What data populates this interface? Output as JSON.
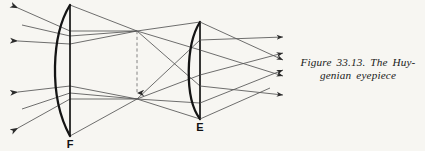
{
  "figure": {
    "background_color": "#f7f6f2",
    "ink_color": "#1a1a1a",
    "ray_color": "#4a4a4a",
    "caption_line_1": "Figure 33.13.  The Huy-",
    "caption_line_2": "genian eyepiece",
    "caption_number": "33.13",
    "caption_subject": "The Huygenian eyepiece"
  },
  "labels": {
    "field_lens": "F",
    "eye_lens": "E"
  },
  "optics": {
    "field_lens": {
      "name": "F",
      "type": "plano-convex",
      "axis_x": 70,
      "top_y": 5,
      "bottom_y": 136,
      "bulge_x": 48,
      "flat_side": "right"
    },
    "eye_lens": {
      "name": "E",
      "type": "plano-convex",
      "axis_x": 200,
      "top_y": 22,
      "bottom_y": 119,
      "bulge_x": 186,
      "flat_side": "right"
    },
    "intermediate_image": {
      "x": 137,
      "top_y": 31,
      "bottom_y": 99,
      "style": "dashed",
      "arrow_at": "bottom"
    },
    "incoming_rays": [
      {
        "group": "upper",
        "y_left": 8,
        "y_lens": 31
      },
      {
        "group": "upper",
        "y_left": 25,
        "y_lens": 36
      },
      {
        "group": "upper",
        "y_left": 41,
        "y_lens": 44
      },
      {
        "group": "lower",
        "y_left": 92,
        "y_lens": 86
      },
      {
        "group": "lower",
        "y_left": 109,
        "y_lens": 93
      },
      {
        "group": "lower",
        "y_left": 128,
        "y_lens": 99
      }
    ],
    "exit_rays_count": 6,
    "exit_arrow_x": 283
  }
}
